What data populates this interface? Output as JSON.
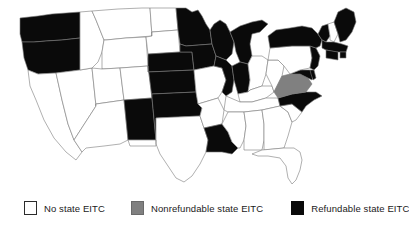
{
  "figure": {
    "type": "choropleth-map",
    "region": "United States",
    "title": ""
  },
  "legend": {
    "items": [
      {
        "label": "No state EITC",
        "color": "#ffffff",
        "swatch": "no-eitc-swatch"
      },
      {
        "label": "Nonrefundable state EITC",
        "color": "#808080",
        "swatch": "nonrefundable-swatch"
      },
      {
        "label": "Refundable state EITC",
        "color": "#0a0a0a",
        "swatch": "refundable-swatch"
      }
    ]
  },
  "map_data": {
    "categories": [
      "No state EITC",
      "Nonrefundable state EITC",
      "Refundable state EITC"
    ],
    "category_colors": {
      "No state EITC": "#ffffff",
      "Nonrefundable state EITC": "#808080",
      "Refundable state EITC": "#0a0a0a"
    },
    "states": {
      "WA": "Refundable state EITC",
      "OR": "Refundable state EITC",
      "CA": "No state EITC",
      "NV": "No state EITC",
      "ID": "No state EITC",
      "MT": "No state EITC",
      "WY": "No state EITC",
      "UT": "No state EITC",
      "AZ": "No state EITC",
      "CO": "No state EITC",
      "NM": "Refundable state EITC",
      "ND": "No state EITC",
      "SD": "No state EITC",
      "NE": "Refundable state EITC",
      "KS": "Refundable state EITC",
      "OK": "Refundable state EITC",
      "TX": "No state EITC",
      "MN": "Refundable state EITC",
      "IA": "Refundable state EITC",
      "MO": "No state EITC",
      "AR": "No state EITC",
      "LA": "Refundable state EITC",
      "WI": "Refundable state EITC",
      "IL": "Refundable state EITC",
      "MI": "Refundable state EITC",
      "IN": "Refundable state EITC",
      "OH": "No state EITC",
      "KY": "No state EITC",
      "TN": "No state EITC",
      "MS": "No state EITC",
      "AL": "No state EITC",
      "GA": "No state EITC",
      "FL": "No state EITC",
      "SC": "No state EITC",
      "NC": "Refundable state EITC",
      "VA": "Nonrefundable state EITC",
      "WV": "No state EITC",
      "MD": "Refundable state EITC",
      "DE": "Refundable state EITC",
      "PA": "No state EITC",
      "NJ": "Refundable state EITC",
      "NY": "Refundable state EITC",
      "CT": "Refundable state EITC",
      "RI": "Refundable state EITC",
      "MA": "Refundable state EITC",
      "VT": "Refundable state EITC",
      "NH": "No state EITC",
      "ME": "Refundable state EITC"
    }
  }
}
